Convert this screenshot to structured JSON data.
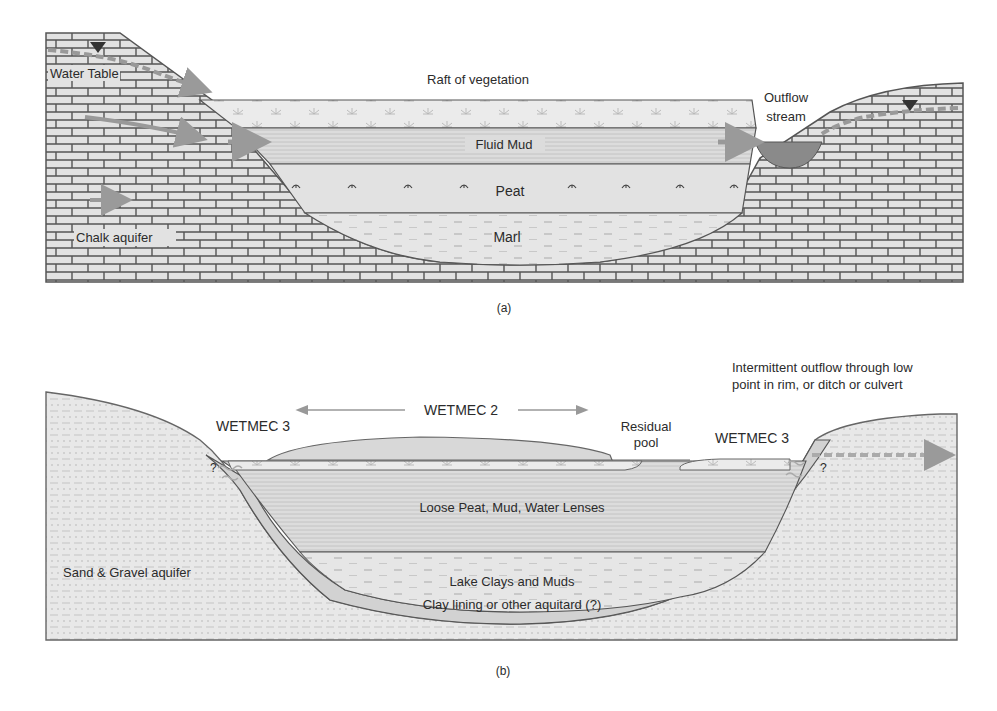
{
  "panel_a": {
    "caption": "(a)",
    "labels": {
      "water_table": "Water Table",
      "raft": "Raft of vegetation",
      "outflow_line1": "Outflow",
      "outflow_line2": "stream",
      "fluid_mud": "Fluid Mud",
      "peat": "Peat",
      "marl": "Marl",
      "chalk_aquifer": "Chalk aquifer"
    }
  },
  "panel_b": {
    "caption": "(b)",
    "labels": {
      "intermittent_line1": "Intermittent outflow through low",
      "intermittent_line2": "point in rim, or ditch or culvert",
      "wetmec2": "WETMEC 2",
      "wetmec3_left": "WETMEC 3",
      "wetmec3_right": "WETMEC 3",
      "residual_line1": "Residual",
      "residual_line2": "pool",
      "question_left": "?",
      "question_right": "?",
      "loose_peat": "Loose Peat, Mud, Water Lenses",
      "lake_clays": "Lake Clays and Muds",
      "clay_lining": "Clay lining or other aquitard (?)",
      "sand_gravel": "Sand & Gravel aquifer"
    }
  },
  "colors": {
    "fill_light": "#e4e4e4",
    "fill_mid": "#d6d6d6",
    "stroke": "#555555",
    "arrow": "#9a9a9a",
    "stream": "#8a8a8a"
  }
}
